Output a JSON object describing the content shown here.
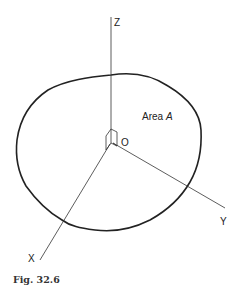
{
  "figure": {
    "caption": "Fig. 32.6",
    "axes": {
      "z_label": "Z",
      "y_label": "Y",
      "x_label": "X",
      "origin_label": "O"
    },
    "region": {
      "label_prefix": "Area ",
      "label_symbol": "A"
    }
  }
}
